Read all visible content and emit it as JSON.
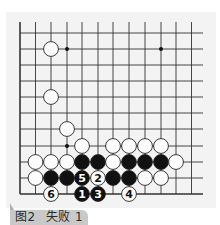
{
  "caption": {
    "figure_label": "图2",
    "title": "失败 1"
  },
  "board": {
    "columns_x": [
      20,
      35.5,
      51,
      67,
      82,
      98,
      113,
      129,
      145,
      161,
      176,
      191.5
    ],
    "rows_y": [
      33,
      49,
      65,
      81,
      97,
      113,
      129,
      146,
      162,
      178,
      194
    ],
    "top_edge_open": true,
    "right_edge_open": true,
    "left_edge": true,
    "bottom_edge": true,
    "star_points": [
      {
        "col": 3,
        "row": 1
      },
      {
        "col": 9,
        "row": 1
      },
      {
        "col": 3,
        "row": 7
      }
    ],
    "stones": [
      {
        "color": "white",
        "col": 2,
        "row": 1
      },
      {
        "color": "white",
        "col": 2,
        "row": 4
      },
      {
        "color": "white",
        "col": 3,
        "row": 6
      },
      {
        "color": "white",
        "col": 4,
        "row": 7
      },
      {
        "color": "white",
        "col": 6,
        "row": 7
      },
      {
        "color": "white",
        "col": 7,
        "row": 7
      },
      {
        "color": "white",
        "col": 8,
        "row": 7
      },
      {
        "color": "white",
        "col": 9,
        "row": 7
      },
      {
        "color": "white",
        "col": 1,
        "row": 8
      },
      {
        "color": "white",
        "col": 2,
        "row": 8
      },
      {
        "color": "white",
        "col": 3,
        "row": 8
      },
      {
        "color": "black",
        "col": 4,
        "row": 8
      },
      {
        "color": "black",
        "col": 5,
        "row": 8
      },
      {
        "color": "white",
        "col": 6,
        "row": 8
      },
      {
        "color": "black",
        "col": 7,
        "row": 8
      },
      {
        "color": "black",
        "col": 8,
        "row": 8
      },
      {
        "color": "black",
        "col": 9,
        "row": 8
      },
      {
        "color": "white",
        "col": 10,
        "row": 8
      },
      {
        "color": "white",
        "col": 1,
        "row": 9
      },
      {
        "color": "black",
        "col": 2,
        "row": 9
      },
      {
        "color": "black",
        "col": 3,
        "row": 9
      },
      {
        "color": "black",
        "col": 4,
        "row": 9,
        "label": "5"
      },
      {
        "color": "white",
        "col": 5,
        "row": 9,
        "label": "2"
      },
      {
        "color": "black",
        "col": 6,
        "row": 9
      },
      {
        "color": "black",
        "col": 7,
        "row": 9
      },
      {
        "color": "white",
        "col": 8,
        "row": 9
      },
      {
        "color": "white",
        "col": 9,
        "row": 9
      },
      {
        "color": "white",
        "col": 2,
        "row": 10,
        "label": "6"
      },
      {
        "color": "black",
        "col": 4,
        "row": 10,
        "label": "1"
      },
      {
        "color": "black",
        "col": 5,
        "row": 10,
        "label": "3"
      },
      {
        "color": "white",
        "col": 7,
        "row": 10,
        "label": "4"
      }
    ],
    "colors": {
      "line": "#333333",
      "black_stone": "#111111",
      "white_stone": "#ffffff",
      "stone_outline": "#222222",
      "board_bg": "#f3f3f3"
    }
  }
}
